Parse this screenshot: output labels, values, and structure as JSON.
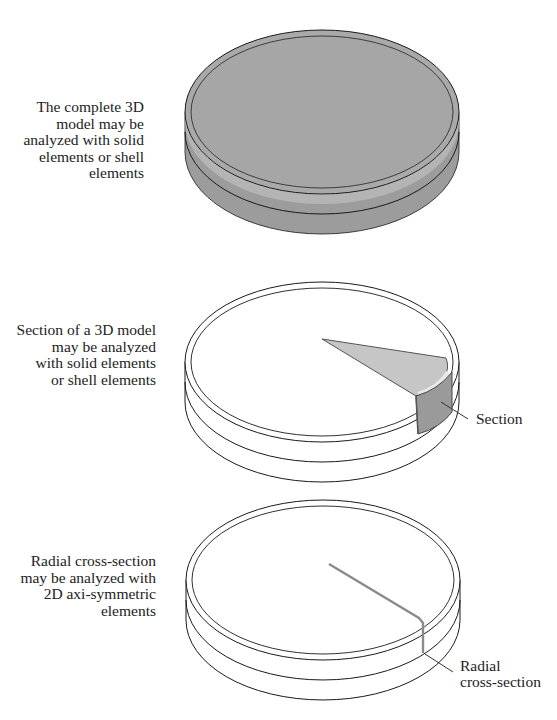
{
  "figure": {
    "panels": [
      {
        "id": "complete-3d-model",
        "caption": "The complete 3D\nmodel may be\nanalyzed with solid\nelements or shell\nelements"
      },
      {
        "id": "section-3d-model",
        "caption": "Section of a 3D model\nmay be analyzed\nwith solid elements\nor shell elements",
        "callout": "Section"
      },
      {
        "id": "radial-cross-section",
        "caption": "Radial cross-section\nmay be analyzed with\n2D axi-symmetric\nelements",
        "callout": "Radial\ncross-section"
      }
    ],
    "colors": {
      "solid_fill": "#a8a8a8",
      "solid_side": "#9c9c9c",
      "rim_highlight": "#e2e2e2",
      "section_top": "#c6c6c6",
      "section_face": "#9a9a9a",
      "outline": "#1a1a1a",
      "radial_line": "#8a8a8a"
    }
  }
}
